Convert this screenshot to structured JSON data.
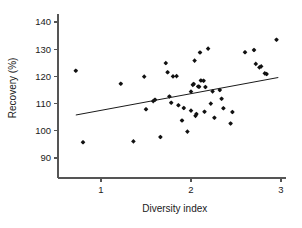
{
  "chart_data": {
    "type": "scatter",
    "title": "",
    "xlabel": "Diversity index",
    "ylabel": "Recovery (%)",
    "xlim": [
      0.63,
      3.05
    ],
    "ylim": [
      85.5,
      143.0
    ],
    "xticks": [
      1,
      2,
      3
    ],
    "xtick_labels": [
      "1",
      "2",
      "3"
    ],
    "yticks": [
      90,
      100,
      110,
      120,
      130,
      140
    ],
    "ytick_labels": [
      "90",
      "100",
      "110",
      "120",
      "130",
      "140"
    ],
    "grid": false,
    "legend": "none",
    "marker": "filled-diamond",
    "marker_color": "#111111",
    "series": [
      {
        "name": "Recovery vs Diversity index",
        "points": [
          [
            0.72,
            122.1
          ],
          [
            0.8,
            95.8
          ],
          [
            1.22,
            117.3
          ],
          [
            1.36,
            96.1
          ],
          [
            1.48,
            119.9
          ],
          [
            1.5,
            107.9
          ],
          [
            1.58,
            110.9
          ],
          [
            1.6,
            111.4
          ],
          [
            1.66,
            97.7
          ],
          [
            1.72,
            124.9
          ],
          [
            1.74,
            121.5
          ],
          [
            1.76,
            112.6
          ],
          [
            1.78,
            110.3
          ],
          [
            1.8,
            120.0
          ],
          [
            1.84,
            120.1
          ],
          [
            1.86,
            109.4
          ],
          [
            1.9,
            103.8
          ],
          [
            1.92,
            108.4
          ],
          [
            1.96,
            99.7
          ],
          [
            2.0,
            107.4
          ],
          [
            2.0,
            114.4
          ],
          [
            2.02,
            116.9
          ],
          [
            2.03,
            117.2
          ],
          [
            2.04,
            125.8
          ],
          [
            2.05,
            105.5
          ],
          [
            2.06,
            106.2
          ],
          [
            2.08,
            116.3
          ],
          [
            2.09,
            116.2
          ],
          [
            2.1,
            128.8
          ],
          [
            2.11,
            118.5
          ],
          [
            2.14,
            118.4
          ],
          [
            2.15,
            107.0
          ],
          [
            2.16,
            116.1
          ],
          [
            2.19,
            130.2
          ],
          [
            2.22,
            110.0
          ],
          [
            2.24,
            114.5
          ],
          [
            2.26,
            104.8
          ],
          [
            2.32,
            115.0
          ],
          [
            2.34,
            111.8
          ],
          [
            2.36,
            108.3
          ],
          [
            2.44,
            102.7
          ],
          [
            2.46,
            106.9
          ],
          [
            2.6,
            128.9
          ],
          [
            2.7,
            129.7
          ],
          [
            2.72,
            124.6
          ],
          [
            2.76,
            123.3
          ],
          [
            2.78,
            123.7
          ],
          [
            2.82,
            121.1
          ],
          [
            2.84,
            120.9
          ],
          [
            2.95,
            133.5
          ]
        ]
      }
    ],
    "fit_line": {
      "name": "linear regression",
      "x_start": 0.72,
      "y_start": 105.8,
      "x_end": 2.97,
      "y_end": 119.6
    }
  }
}
